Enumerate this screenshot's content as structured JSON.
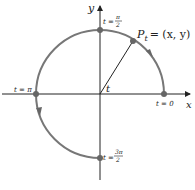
{
  "diagram": {
    "type": "unit-circle-parametrization",
    "axes": {
      "x_label": "x",
      "y_label": "y"
    },
    "point_label": "P",
    "point_sub": "t",
    "point_coords": "= (x, y)",
    "angle_label": "t",
    "markers": [
      {
        "id": "t0",
        "label": "t = 0",
        "t": "0"
      },
      {
        "id": "tpi2",
        "label_prefix": "t =",
        "num": "π",
        "den": "2"
      },
      {
        "id": "tpi",
        "label": "t = π"
      },
      {
        "id": "t3pi2",
        "label_prefix": "t =",
        "num": "3π",
        "den": "2"
      }
    ],
    "arc_color": "#777777",
    "axis_color": "#222222"
  }
}
